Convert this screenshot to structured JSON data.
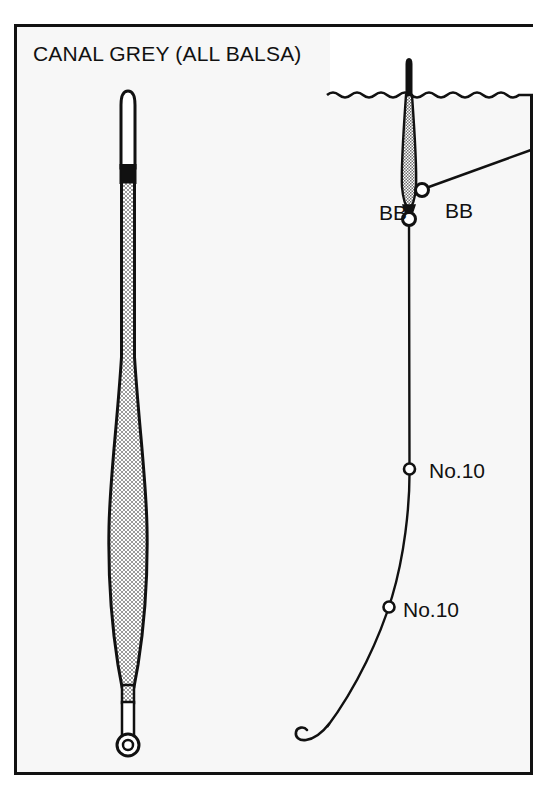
{
  "plate": {
    "title": "CANAL GREY (ALL BALSA)",
    "background_color": "#f7f7f7",
    "border_color": "#111111",
    "water_color": "#f7f7f7",
    "air_color": "#ffffff",
    "ink_color": "#111111"
  },
  "float_profile": {
    "name": "canal-grey-float",
    "tip": {
      "label": "white antenna tip",
      "fill": "#ffffff"
    },
    "band": {
      "label": "black sight band",
      "fill": "#111111"
    },
    "body": {
      "label": "stippled balsa body",
      "fill": "stipple"
    },
    "stem": {
      "label": "white wire stem",
      "fill": "#ffffff"
    },
    "eye": {
      "label": "bottom eye ring"
    }
  },
  "rig": {
    "waterline_label": "water surface",
    "float_label": "float in water",
    "hook_label": "hook",
    "pointer_label": "shot pointer line",
    "shots": [
      {
        "id": "bb-on-line",
        "label": "BB",
        "kind": "bb"
      },
      {
        "id": "bb-pointer",
        "label": "BB",
        "kind": "bb"
      },
      {
        "id": "no10-upper",
        "label": "No.10",
        "kind": "no10"
      },
      {
        "id": "no10-lower",
        "label": "No.10",
        "kind": "no10"
      }
    ]
  }
}
